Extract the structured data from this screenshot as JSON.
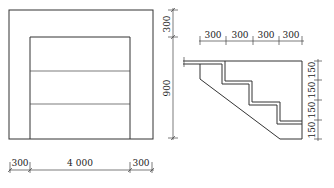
{
  "front_view": {
    "outer": {
      "x": 9,
      "y": 10,
      "w": 144,
      "h": 129
    },
    "opening": {
      "x": 30,
      "y": 37,
      "w": 100,
      "h": 102
    },
    "panel_lines_y": [
      71,
      104
    ],
    "dim_vertical": {
      "labels": [
        "300",
        "900"
      ]
    },
    "dim_bottom": {
      "labels": [
        "300",
        "4 000",
        "300"
      ]
    }
  },
  "section_view": {
    "dim_top": {
      "labels": [
        "300",
        "300",
        "300",
        "300"
      ]
    },
    "dim_right": {
      "labels": [
        "150",
        "150",
        "150",
        "150"
      ]
    }
  },
  "colors": {
    "line": "#333333",
    "background": "#ffffff"
  }
}
